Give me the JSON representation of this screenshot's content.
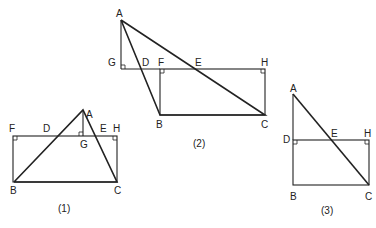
{
  "figures": [
    {
      "caption": "(1)",
      "labels": {
        "A": "A",
        "B": "B",
        "C": "C",
        "D": "D",
        "E": "E",
        "F": "F",
        "G": "G",
        "H": "H"
      }
    },
    {
      "caption": "(2)",
      "labels": {
        "A": "A",
        "B": "B",
        "C": "C",
        "D": "D",
        "E": "E",
        "F": "F",
        "G": "G",
        "H": "H"
      }
    },
    {
      "caption": "(3)",
      "labels": {
        "A": "A",
        "B": "B",
        "C": "C",
        "D": "D",
        "E": "E",
        "H": "H"
      }
    }
  ]
}
